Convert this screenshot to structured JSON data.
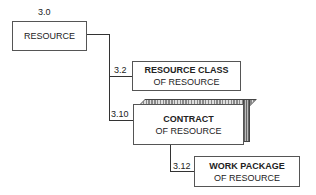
{
  "nodes": [
    {
      "id": "3.0",
      "number": "3.0",
      "line1": "RESOURCE",
      "line2": ""
    },
    {
      "id": "3.2",
      "number": "3.2",
      "line1": "RESOURCE CLASS",
      "line2": "OF RESOURCE"
    },
    {
      "id": "3.10",
      "number": "3.10",
      "line1": "CONTRACT",
      "line2": "OF RESOURCE"
    },
    {
      "id": "3.12",
      "number": "3.12",
      "line1": "WORK PACKAGE",
      "line2": "OF RESOURCE"
    }
  ]
}
